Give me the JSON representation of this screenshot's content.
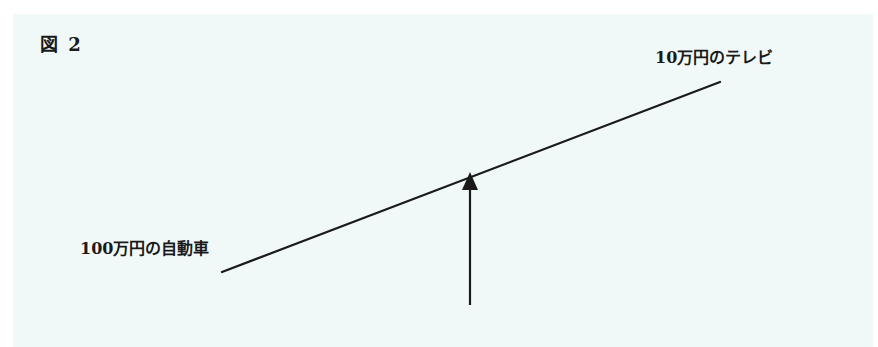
{
  "figure": {
    "label": "図 2",
    "background_color": "#f1f9f8",
    "line_color": "#1a1a1a"
  },
  "lever": {
    "left_end_label": "100万円の自動車",
    "right_end_label": "10万円のテレビ",
    "beam": {
      "x1": 222,
      "y1": 272,
      "x2": 720,
      "y2": 82
    },
    "fulcrum_arrow": {
      "x": 470,
      "y_bottom": 305,
      "y_tip": 172,
      "direction": "up"
    }
  }
}
